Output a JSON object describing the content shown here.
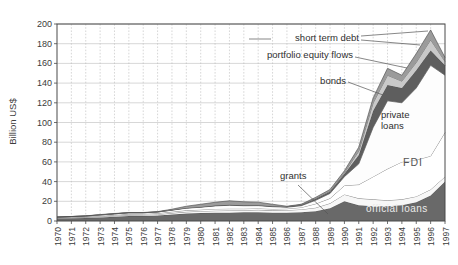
{
  "figure": {
    "background": "#ffffff"
  },
  "chart_data": {
    "type": "area",
    "stacked": true,
    "title": "",
    "xlabel": "",
    "ylabel": "Billion US$",
    "ylim": [
      0,
      200
    ],
    "y_ticks": [
      0,
      20,
      40,
      60,
      80,
      100,
      120,
      140,
      160,
      180,
      200
    ],
    "grid": true,
    "x": [
      1970,
      1971,
      1972,
      1973,
      1974,
      1975,
      1976,
      1977,
      1978,
      1979,
      1980,
      1981,
      1982,
      1983,
      1984,
      1985,
      1986,
      1987,
      1988,
      1989,
      1990,
      1991,
      1992,
      1993,
      1994,
      1995,
      1996,
      1997
    ],
    "series": [
      {
        "name": "official loans",
        "color": "#696969",
        "values": [
          2.5,
          2.8,
          3.0,
          3.5,
          4.2,
          5.0,
          5.0,
          5.5,
          6.5,
          7.5,
          8.0,
          8.5,
          8.5,
          8.8,
          9.0,
          8.5,
          8.5,
          9.0,
          10.0,
          13.0,
          20.0,
          16.0,
          15.0,
          15.0,
          16.0,
          19.0,
          26.0,
          40.0
        ]
      },
      {
        "name": "grants",
        "color": "#f7f7f7",
        "values": [
          0.5,
          0.6,
          0.7,
          0.8,
          1.0,
          1.0,
          1.1,
          1.2,
          1.5,
          1.8,
          2.0,
          2.0,
          2.2,
          2.2,
          2.3,
          2.3,
          2.5,
          2.8,
          3.5,
          5.0,
          7.0,
          7.0,
          7.0,
          6.0,
          6.0,
          6.0,
          6.0,
          5.0
        ]
      },
      {
        "name": "FDI",
        "color": "#ffffff",
        "values": [
          0.5,
          0.5,
          0.6,
          0.8,
          0.8,
          1.0,
          1.0,
          1.1,
          1.3,
          1.5,
          1.5,
          1.8,
          1.8,
          1.5,
          1.5,
          1.4,
          1.5,
          2.0,
          4.0,
          5.0,
          9.0,
          14.0,
          23.0,
          32.0,
          38.0,
          37.0,
          34.0,
          45.0
        ]
      },
      {
        "name": "private loans",
        "color": "#fdfdfd",
        "values": [
          0.5,
          0.6,
          0.7,
          1.0,
          1.2,
          1.3,
          1.2,
          1.3,
          1.7,
          2.2,
          2.5,
          3.0,
          3.5,
          3.0,
          2.8,
          2.3,
          1.5,
          1.7,
          3.5,
          5.0,
          9.0,
          21.0,
          50.0,
          69.0,
          60.0,
          73.0,
          92.0,
          58.0
        ]
      },
      {
        "name": "bonds",
        "color": "#5e5e5e",
        "values": [
          0,
          0,
          0.1,
          0.1,
          0.1,
          0.1,
          0.1,
          0.1,
          0.2,
          0.3,
          0.3,
          0.4,
          0.5,
          0.5,
          0.5,
          0.5,
          0.5,
          0.7,
          1.5,
          2.0,
          3.0,
          9.0,
          17.0,
          16.0,
          15.0,
          18.0,
          15.0,
          10.0
        ]
      },
      {
        "name": "portfolio equity flows",
        "color": "#c9c9c9",
        "values": [
          0,
          0,
          0,
          0,
          0,
          0,
          0,
          0,
          0,
          0,
          0,
          0,
          0,
          0,
          0,
          0,
          0,
          0.3,
          0.5,
          0.5,
          1.0,
          4.0,
          8.0,
          10.0,
          7.0,
          8.0,
          11.0,
          4.0
        ]
      },
      {
        "name": "short term debt",
        "color": "#9b9b9b",
        "values": [
          0,
          0.1,
          0.1,
          0.3,
          0.3,
          0.2,
          0.2,
          0.3,
          0.8,
          1.7,
          2.7,
          3.3,
          4.0,
          3.5,
          3.0,
          2.0,
          0.5,
          0.5,
          1.0,
          1.5,
          2.0,
          4.0,
          5.0,
          7.0,
          6.0,
          9.0,
          10.0,
          4.0
        ]
      }
    ],
    "annotations": {
      "short_term_debt": {
        "text": "short term debt"
      },
      "portfolio_equity_flows": {
        "text": "portfolio equity flows"
      },
      "bonds": {
        "text": "bonds"
      },
      "grants": {
        "text": "grants"
      },
      "private_loans": {
        "text": "private loans"
      },
      "fdi": {
        "text": "FDI"
      },
      "official_loans": {
        "text": "official loans"
      }
    },
    "leader_lines": [
      {
        "name": "short-term-debt-dash",
        "x1": 249,
        "y1": 39,
        "x2": 271,
        "y2": 39
      },
      {
        "name": "short-term-debt-leader-1",
        "x1": 361,
        "y1": 36,
        "x2": 428,
        "y2": 31
      },
      {
        "name": "short-term-debt-leader-2",
        "x1": 361,
        "y1": 40,
        "x2": 420,
        "y2": 45
      },
      {
        "name": "portfolio-equity-leader",
        "x1": 355,
        "y1": 57,
        "x2": 407,
        "y2": 68
      },
      {
        "name": "bonds-leader",
        "x1": 348,
        "y1": 82,
        "x2": 383,
        "y2": 95
      },
      {
        "name": "grants-leader",
        "x1": 298,
        "y1": 185,
        "x2": 328,
        "y2": 214
      }
    ],
    "axis_color": "#4a4a4a",
    "gridline_color": "#bcbcbc",
    "boundary_line_color": "#4d4d4d"
  }
}
